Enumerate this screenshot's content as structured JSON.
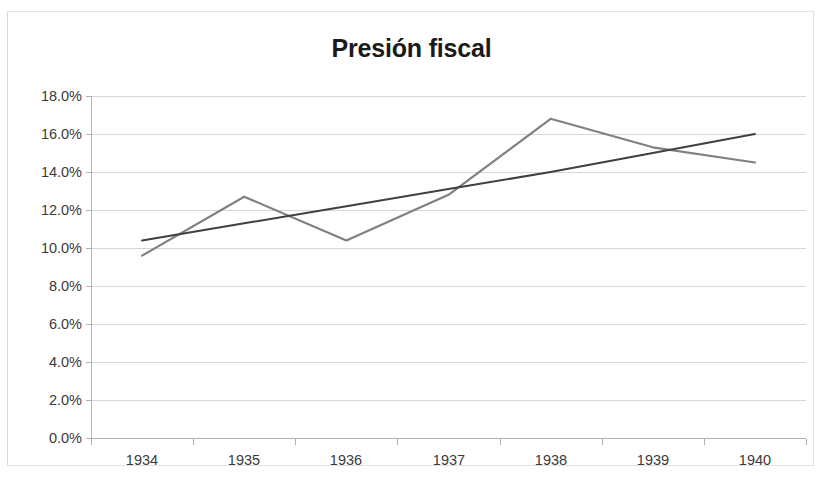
{
  "chart_data": {
    "type": "line",
    "title": "Presión fiscal",
    "xlabel": "",
    "ylabel": "",
    "categories": [
      "1934",
      "1935",
      "1936",
      "1937",
      "1938",
      "1939",
      "1940"
    ],
    "series": [
      {
        "name": "Presión fiscal",
        "color": "#808080",
        "values": [
          9.6,
          12.7,
          10.4,
          12.8,
          16.8,
          15.3,
          14.5
        ]
      },
      {
        "name": "Lineal (Presión fiscal)",
        "color": "#404040",
        "trendline": true,
        "values": [
          10.4,
          11.3,
          12.2,
          13.1,
          14.0,
          15.0,
          16.0
        ]
      }
    ],
    "ylim": [
      0,
      18
    ],
    "ytick_values": [
      18,
      16,
      14,
      12,
      10,
      8,
      6,
      4,
      2,
      0
    ],
    "ytick_labels": [
      "18.0%",
      "16.0%",
      "14.0%",
      "12.0%",
      "10.0%",
      "8.0%",
      "6.0%",
      "4.0%",
      "2.0%",
      "0.0%"
    ],
    "grid": true,
    "grid_axis": "y",
    "legend": "none",
    "gridline_color": "#d6d6d6",
    "axis_color": "#b0b0b0",
    "background": "#ffffff"
  }
}
